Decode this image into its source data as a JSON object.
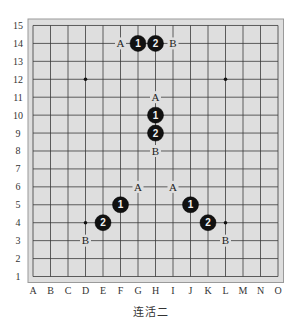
{
  "board": {
    "columns": [
      "A",
      "B",
      "C",
      "D",
      "E",
      "F",
      "G",
      "H",
      "I",
      "J",
      "K",
      "L",
      "M",
      "N",
      "O"
    ],
    "rows": [
      "1",
      "2",
      "3",
      "4",
      "5",
      "6",
      "7",
      "8",
      "9",
      "10",
      "11",
      "12",
      "13",
      "14",
      "15"
    ],
    "background_color": "#dedede",
    "line_color": "#3a3a3a",
    "star_points": [
      "D12",
      "L12",
      "D4",
      "L4"
    ],
    "stones": [
      {
        "pos": "G14",
        "color": "black",
        "label": "1"
      },
      {
        "pos": "H14",
        "color": "black",
        "label": "2"
      },
      {
        "pos": "H10",
        "color": "black",
        "label": "1"
      },
      {
        "pos": "H9",
        "color": "black",
        "label": "2"
      },
      {
        "pos": "F5",
        "color": "black",
        "label": "1"
      },
      {
        "pos": "E4",
        "color": "black",
        "label": "2"
      },
      {
        "pos": "J5",
        "color": "black",
        "label": "1"
      },
      {
        "pos": "K4",
        "color": "black",
        "label": "2"
      }
    ],
    "marks": [
      {
        "pos": "F14",
        "label": "A"
      },
      {
        "pos": "I14",
        "label": "B"
      },
      {
        "pos": "H11",
        "label": "A"
      },
      {
        "pos": "H8",
        "label": "B"
      },
      {
        "pos": "G6",
        "label": "A"
      },
      {
        "pos": "D3",
        "label": "B"
      },
      {
        "pos": "I6",
        "label": "A"
      },
      {
        "pos": "L3",
        "label": "B"
      }
    ]
  },
  "caption": "连活二"
}
